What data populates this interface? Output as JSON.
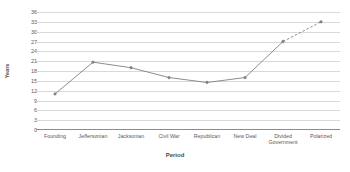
{
  "chart_data": {
    "type": "line",
    "title": "",
    "xlabel": "Period",
    "ylabel": "Years",
    "categories": [
      "Founding",
      "Jeffersonian",
      "Jacksonian",
      "Civil War",
      "Republican",
      "New Deal",
      "Divided\nGovernment",
      "Polarized"
    ],
    "values": [
      11,
      20.7,
      19,
      16,
      14.5,
      16,
      27,
      33
    ],
    "ylim": [
      0,
      36
    ],
    "ytick_step": 3,
    "ytick_labels": [
      "36",
      "33",
      "30",
      "27",
      "24",
      "21",
      "18",
      "15",
      "12",
      "9",
      "6",
      "3",
      "0"
    ],
    "grid": true,
    "legend": "none",
    "series_color": "#808080",
    "grid_color": "#d9d9d9",
    "axis_color": "#8c8c8c",
    "dashed_from_index": 6,
    "marker": "diamond"
  },
  "axis_titles": {
    "x": "Period",
    "y": "Years"
  }
}
